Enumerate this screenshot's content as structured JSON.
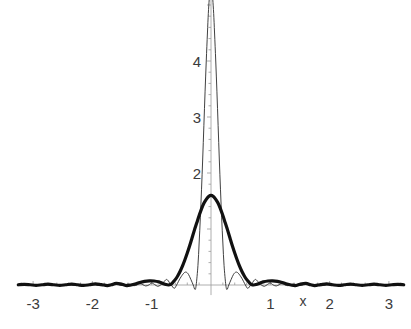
{
  "chart_data": {
    "type": "line",
    "title": "",
    "subtitle": "",
    "xlabel": "x",
    "ylabel": "",
    "xlim": [
      -3.25,
      3.25
    ],
    "ylim": [
      -0.18,
      5.2
    ],
    "grid": false,
    "legend": "none",
    "background": "#ffffff",
    "axis_color": "#9a9a9a",
    "tick_label_color": "#3b3b3b",
    "x_ticks": [
      -3,
      -2,
      -1,
      1,
      2,
      3
    ],
    "x_tick_labels": [
      "-3",
      "-2",
      "-1",
      "1",
      "2",
      "3"
    ],
    "y_ticks": [
      2,
      3,
      4
    ],
    "y_tick_labels": [
      "2",
      "3",
      "4"
    ],
    "minor_tick_interval_x": 0.2,
    "minor_tick_interval_y": 0.2,
    "x_axis_y_value": 0,
    "y_axis_x_value": 0,
    "annotations": [
      {
        "text": "x",
        "x": 1.55,
        "y": -0.13,
        "role": "x-axis-name"
      }
    ],
    "series": [
      {
        "name": "narrow-kernel",
        "style": "thin",
        "color": "#2b2b2b",
        "linewidth": 0.9,
        "description": "Tall narrow Dirichlet-type kernel, peak clipped by top of plot",
        "peak_value": 5.4,
        "peak_x": 0.0,
        "first_zero_x": 0.25,
        "sidelobe_peaks": [
          {
            "x": -0.42,
            "y": 0.23
          },
          {
            "x": 0.42,
            "y": 0.23
          },
          {
            "x": -0.65,
            "y": 0.1
          },
          {
            "x": 0.65,
            "y": 0.1
          }
        ],
        "points": [
          [
            -3.25,
            0.002
          ],
          [
            -3.2,
            0.006
          ],
          [
            -3.15,
            0.002
          ],
          [
            -3.1,
            -0.004
          ],
          [
            -3.05,
            0.0
          ],
          [
            -3.0,
            0.006
          ],
          [
            -2.95,
            0.002
          ],
          [
            -2.9,
            -0.004
          ],
          [
            -2.85,
            0.0
          ],
          [
            -2.8,
            0.007
          ],
          [
            -2.75,
            0.002
          ],
          [
            -2.7,
            -0.005
          ],
          [
            -2.65,
            0.0
          ],
          [
            -2.6,
            0.008
          ],
          [
            -2.55,
            0.002
          ],
          [
            -2.5,
            -0.006
          ],
          [
            -2.45,
            0.0
          ],
          [
            -2.4,
            0.009
          ],
          [
            -2.35,
            0.002
          ],
          [
            -2.3,
            -0.006
          ],
          [
            -2.25,
            0.0
          ],
          [
            -2.2,
            0.01
          ],
          [
            -2.15,
            0.002
          ],
          [
            -2.1,
            -0.007
          ],
          [
            -2.05,
            0.0
          ],
          [
            -2.0,
            0.012
          ],
          [
            -1.95,
            0.003
          ],
          [
            -1.9,
            -0.008
          ],
          [
            -1.85,
            0.0
          ],
          [
            -1.8,
            0.014
          ],
          [
            -1.75,
            0.003
          ],
          [
            -1.7,
            -0.009
          ],
          [
            -1.65,
            0.0
          ],
          [
            -1.6,
            0.017
          ],
          [
            -1.55,
            0.004
          ],
          [
            -1.5,
            -0.011
          ],
          [
            -1.45,
            0.0
          ],
          [
            -1.4,
            0.02
          ],
          [
            -1.35,
            0.005
          ],
          [
            -1.3,
            -0.013
          ],
          [
            -1.25,
            0.0
          ],
          [
            -1.2,
            0.026
          ],
          [
            -1.15,
            0.006
          ],
          [
            -1.1,
            -0.017
          ],
          [
            -1.05,
            0.0
          ],
          [
            -1.0,
            0.034
          ],
          [
            -0.95,
            0.008
          ],
          [
            -0.9,
            -0.023
          ],
          [
            -0.85,
            0.0
          ],
          [
            -0.8,
            0.05
          ],
          [
            -0.78,
            0.075
          ],
          [
            -0.75,
            0.1
          ],
          [
            -0.72,
            0.075
          ],
          [
            -0.7,
            0.04
          ],
          [
            -0.67,
            0.0
          ],
          [
            -0.62,
            -0.06
          ],
          [
            -0.58,
            0.0
          ],
          [
            -0.52,
            0.12
          ],
          [
            -0.46,
            0.21
          ],
          [
            -0.42,
            0.23
          ],
          [
            -0.38,
            0.19
          ],
          [
            -0.34,
            0.1
          ],
          [
            -0.3,
            0.0
          ],
          [
            -0.27,
            -0.08
          ],
          [
            -0.25,
            0.0
          ],
          [
            -0.22,
            0.35
          ],
          [
            -0.2,
            0.75
          ],
          [
            -0.18,
            1.2
          ],
          [
            -0.16,
            1.7
          ],
          [
            -0.14,
            2.25
          ],
          [
            -0.12,
            2.85
          ],
          [
            -0.1,
            3.45
          ],
          [
            -0.08,
            4.0
          ],
          [
            -0.06,
            4.5
          ],
          [
            -0.045,
            4.85
          ],
          [
            -0.03,
            5.1
          ],
          [
            -0.015,
            5.3
          ],
          [
            0.0,
            5.4
          ],
          [
            0.015,
            5.3
          ],
          [
            0.03,
            5.1
          ],
          [
            0.045,
            4.85
          ],
          [
            0.06,
            4.5
          ],
          [
            0.08,
            4.0
          ],
          [
            0.1,
            3.45
          ],
          [
            0.12,
            2.85
          ],
          [
            0.14,
            2.25
          ],
          [
            0.16,
            1.7
          ],
          [
            0.18,
            1.2
          ],
          [
            0.2,
            0.75
          ],
          [
            0.22,
            0.35
          ],
          [
            0.25,
            0.0
          ],
          [
            0.27,
            -0.08
          ],
          [
            0.3,
            0.0
          ],
          [
            0.34,
            0.1
          ],
          [
            0.38,
            0.19
          ],
          [
            0.42,
            0.23
          ],
          [
            0.46,
            0.21
          ],
          [
            0.52,
            0.12
          ],
          [
            0.58,
            0.0
          ],
          [
            0.62,
            -0.06
          ],
          [
            0.67,
            0.0
          ],
          [
            0.7,
            0.04
          ],
          [
            0.72,
            0.075
          ],
          [
            0.75,
            0.1
          ],
          [
            0.78,
            0.075
          ],
          [
            0.8,
            0.05
          ],
          [
            0.85,
            0.0
          ],
          [
            0.9,
            -0.023
          ],
          [
            0.95,
            0.008
          ],
          [
            1.0,
            0.034
          ],
          [
            1.05,
            0.0
          ],
          [
            1.1,
            -0.017
          ],
          [
            1.15,
            0.006
          ],
          [
            1.2,
            0.026
          ],
          [
            1.25,
            0.0
          ],
          [
            1.3,
            -0.013
          ],
          [
            1.35,
            0.005
          ],
          [
            1.4,
            0.02
          ],
          [
            1.45,
            0.0
          ],
          [
            1.5,
            -0.011
          ],
          [
            1.55,
            0.004
          ],
          [
            1.6,
            0.017
          ],
          [
            1.65,
            0.0
          ],
          [
            1.7,
            -0.009
          ],
          [
            1.75,
            0.003
          ],
          [
            1.8,
            0.014
          ],
          [
            1.85,
            0.0
          ],
          [
            1.9,
            -0.008
          ],
          [
            1.95,
            0.003
          ],
          [
            2.0,
            0.012
          ],
          [
            2.05,
            0.0
          ],
          [
            2.1,
            -0.007
          ],
          [
            2.15,
            0.002
          ],
          [
            2.2,
            0.01
          ],
          [
            2.25,
            0.0
          ],
          [
            2.3,
            -0.006
          ],
          [
            2.35,
            0.002
          ],
          [
            2.4,
            0.009
          ],
          [
            2.45,
            0.0
          ],
          [
            2.5,
            -0.006
          ],
          [
            2.55,
            0.002
          ],
          [
            2.6,
            0.008
          ],
          [
            2.65,
            0.0
          ],
          [
            2.7,
            -0.005
          ],
          [
            2.75,
            0.002
          ],
          [
            2.8,
            0.007
          ],
          [
            2.85,
            0.0
          ],
          [
            2.9,
            -0.004
          ],
          [
            2.95,
            0.002
          ],
          [
            3.0,
            0.006
          ],
          [
            3.05,
            0.0
          ],
          [
            3.1,
            -0.004
          ],
          [
            3.15,
            0.002
          ],
          [
            3.2,
            0.006
          ],
          [
            3.25,
            0.002
          ]
        ]
      },
      {
        "name": "broad-kernel",
        "style": "thick",
        "color": "#111111",
        "linewidth": 3.2,
        "description": "Broad bold kernel with low decaying sidelobes",
        "peak_value": 1.6,
        "peak_x": 0.0,
        "first_zero_x": 0.72,
        "sidelobe_peaks": [
          {
            "x": -1.0,
            "y": 0.075
          },
          {
            "x": 1.0,
            "y": 0.075
          },
          {
            "x": -1.6,
            "y": 0.03
          },
          {
            "x": 1.6,
            "y": 0.03
          }
        ],
        "points": [
          [
            -3.25,
            0.004
          ],
          [
            -3.15,
            0.012
          ],
          [
            -3.05,
            0.004
          ],
          [
            -2.95,
            -0.006
          ],
          [
            -2.85,
            0.004
          ],
          [
            -2.75,
            0.014
          ],
          [
            -2.65,
            0.004
          ],
          [
            -2.55,
            -0.007
          ],
          [
            -2.45,
            0.004
          ],
          [
            -2.35,
            0.016
          ],
          [
            -2.25,
            0.004
          ],
          [
            -2.15,
            -0.008
          ],
          [
            -2.05,
            0.004
          ],
          [
            -1.95,
            0.02
          ],
          [
            -1.85,
            0.006
          ],
          [
            -1.75,
            -0.01
          ],
          [
            -1.68,
            0.004
          ],
          [
            -1.6,
            0.03
          ],
          [
            -1.5,
            0.014
          ],
          [
            -1.42,
            -0.012
          ],
          [
            -1.35,
            0.0
          ],
          [
            -1.28,
            0.018
          ],
          [
            -1.2,
            0.046
          ],
          [
            -1.12,
            0.066
          ],
          [
            -1.04,
            0.075
          ],
          [
            -0.96,
            0.072
          ],
          [
            -0.88,
            0.056
          ],
          [
            -0.82,
            0.032
          ],
          [
            -0.76,
            0.008
          ],
          [
            -0.72,
            0.0
          ],
          [
            -0.68,
            0.012
          ],
          [
            -0.64,
            0.05
          ],
          [
            -0.6,
            0.1
          ],
          [
            -0.56,
            0.165
          ],
          [
            -0.52,
            0.245
          ],
          [
            -0.48,
            0.34
          ],
          [
            -0.44,
            0.45
          ],
          [
            -0.4,
            0.57
          ],
          [
            -0.36,
            0.7
          ],
          [
            -0.32,
            0.84
          ],
          [
            -0.28,
            0.98
          ],
          [
            -0.24,
            1.11
          ],
          [
            -0.2,
            1.24
          ],
          [
            -0.16,
            1.36
          ],
          [
            -0.12,
            1.46
          ],
          [
            -0.08,
            1.53
          ],
          [
            -0.04,
            1.58
          ],
          [
            0.0,
            1.6
          ],
          [
            0.04,
            1.58
          ],
          [
            0.08,
            1.53
          ],
          [
            0.12,
            1.46
          ],
          [
            0.16,
            1.36
          ],
          [
            0.2,
            1.24
          ],
          [
            0.24,
            1.11
          ],
          [
            0.28,
            0.98
          ],
          [
            0.32,
            0.84
          ],
          [
            0.36,
            0.7
          ],
          [
            0.4,
            0.57
          ],
          [
            0.44,
            0.45
          ],
          [
            0.48,
            0.34
          ],
          [
            0.52,
            0.245
          ],
          [
            0.56,
            0.165
          ],
          [
            0.6,
            0.1
          ],
          [
            0.64,
            0.05
          ],
          [
            0.68,
            0.012
          ],
          [
            0.72,
            0.0
          ],
          [
            0.76,
            0.008
          ],
          [
            0.82,
            0.032
          ],
          [
            0.88,
            0.056
          ],
          [
            0.96,
            0.072
          ],
          [
            1.04,
            0.075
          ],
          [
            1.12,
            0.066
          ],
          [
            1.2,
            0.046
          ],
          [
            1.28,
            0.018
          ],
          [
            1.35,
            0.0
          ],
          [
            1.42,
            -0.012
          ],
          [
            1.5,
            0.014
          ],
          [
            1.6,
            0.03
          ],
          [
            1.68,
            0.004
          ],
          [
            1.75,
            -0.01
          ],
          [
            1.85,
            0.006
          ],
          [
            1.95,
            0.02
          ],
          [
            2.05,
            0.004
          ],
          [
            2.15,
            -0.008
          ],
          [
            2.25,
            0.004
          ],
          [
            2.35,
            0.016
          ],
          [
            2.45,
            0.004
          ],
          [
            2.55,
            -0.007
          ],
          [
            2.65,
            0.004
          ],
          [
            2.75,
            0.014
          ],
          [
            2.85,
            0.004
          ],
          [
            2.95,
            -0.006
          ],
          [
            3.05,
            0.004
          ],
          [
            3.15,
            0.012
          ],
          [
            3.25,
            0.004
          ]
        ]
      }
    ]
  },
  "figure": {
    "caption": "",
    "alt": "Two superimposed kernel curves on a shared axis"
  }
}
